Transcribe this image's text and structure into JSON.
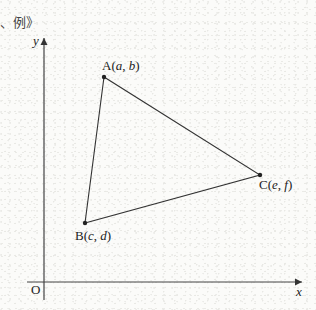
{
  "caption": "、例》",
  "axes": {
    "x_label": "x",
    "y_label": "y",
    "origin_label": "O"
  },
  "points": [
    {
      "id": "A",
      "label": "A(a, b)",
      "name": "A",
      "coords": "(a, b)",
      "px": 104,
      "py": 77
    },
    {
      "id": "B",
      "label": "B(c, d)",
      "name": "B",
      "coords": "(c, d)",
      "px": 85,
      "py": 223
    },
    {
      "id": "C",
      "label": "C(e, f)",
      "name": "C",
      "coords": "(e, f)",
      "px": 260,
      "py": 175
    }
  ],
  "colors": {
    "line": "#333333",
    "background": "#fbfbf9"
  }
}
